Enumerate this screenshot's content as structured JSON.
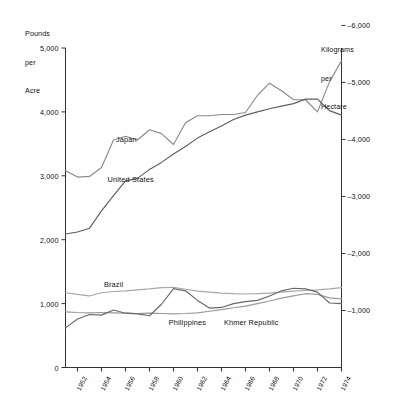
{
  "chart_data": {
    "type": "line",
    "title": "",
    "subtitle": "",
    "left_axis": {
      "label": "Pounds\nper\nAcre",
      "label_lines": [
        "Pounds",
        "per",
        "Acre"
      ],
      "ticks": [
        0,
        1000,
        2000,
        3000,
        4000,
        5000
      ],
      "tick_labels": [
        "0",
        "1,000",
        "2,000",
        "3,000",
        "4,000",
        "5,000"
      ],
      "ylim": [
        0,
        5000
      ],
      "units": "Pounds per Acre"
    },
    "right_axis": {
      "label": "Kilograms\nper\nHectare",
      "label_lines": [
        "Kilograms",
        "per",
        "Hectare"
      ],
      "ticks": [
        1000,
        2000,
        3000,
        4000,
        5000,
        6000
      ],
      "tick_labels": [
        "1,000",
        "2,000",
        "3,000",
        "4,000",
        "5,000",
        "6,000"
      ],
      "ylim": [
        0,
        5604
      ],
      "units": "Kilograms per Hectare"
    },
    "xlabel": "",
    "x": [
      1951,
      1952,
      1953,
      1954,
      1955,
      1956,
      1957,
      1958,
      1959,
      1960,
      1961,
      1962,
      1963,
      1964,
      1965,
      1966,
      1967,
      1968,
      1969,
      1970,
      1971,
      1972,
      1973,
      1974
    ],
    "xlim": [
      1951,
      1974
    ],
    "xtick_labels": [
      "1952",
      "1954",
      "1956",
      "1958",
      "1960",
      "1962",
      "1964",
      "1966",
      "1968",
      "1970",
      "1972",
      "1974"
    ],
    "xticks": [
      1952,
      1954,
      1956,
      1958,
      1960,
      1962,
      1964,
      1966,
      1968,
      1970,
      1972,
      1974
    ],
    "grid": false,
    "legend": "inline-labels",
    "series": [
      {
        "name": "Japan",
        "color": "#8a8a8a",
        "label_position": {
          "x": 1955.2,
          "y": 3560
        },
        "values": [
          3080,
          2980,
          2990,
          3130,
          3560,
          3620,
          3560,
          3720,
          3660,
          3490,
          3830,
          3940,
          3940,
          3960,
          3960,
          3990,
          4260,
          4450,
          4330,
          4190,
          4190,
          4000,
          4470,
          4800
        ]
      },
      {
        "name": "United States",
        "color": "#5f5f5f",
        "label_position": {
          "x": 1954.5,
          "y": 2940
        },
        "values": [
          2090,
          2120,
          2180,
          2450,
          2690,
          2920,
          2960,
          3100,
          3210,
          3340,
          3460,
          3590,
          3690,
          3780,
          3880,
          3950,
          4000,
          4050,
          4090,
          4130,
          4200,
          4200,
          4020,
          3950
        ]
      },
      {
        "name": "Brazil",
        "color": "#a8a8a8",
        "label_position": {
          "x": 1954.2,
          "y": 1285
        },
        "values": [
          1170,
          1145,
          1120,
          1170,
          1190,
          1200,
          1215,
          1230,
          1250,
          1255,
          1225,
          1195,
          1180,
          1165,
          1155,
          1150,
          1155,
          1165,
          1180,
          1195,
          1205,
          1215,
          1230,
          1250
        ]
      },
      {
        "name": "Philippines",
        "color": "#9a9a9a",
        "label_position": {
          "x": 1959.6,
          "y": 700
        },
        "values": [
          870,
          860,
          855,
          860,
          855,
          850,
          845,
          850,
          845,
          840,
          845,
          855,
          880,
          905,
          935,
          960,
          1000,
          1040,
          1085,
          1120,
          1155,
          1145,
          1090,
          1075
        ]
      },
      {
        "name": "Khmer Republic",
        "color": "#6a6a6a",
        "label_position": {
          "x": 1964.2,
          "y": 700
        },
        "values": [
          620,
          760,
          830,
          820,
          900,
          850,
          840,
          810,
          990,
          1235,
          1200,
          1050,
          930,
          940,
          1000,
          1030,
          1050,
          1120,
          1200,
          1240,
          1230,
          1180,
          1010,
          1000
        ]
      }
    ],
    "annotations": []
  }
}
